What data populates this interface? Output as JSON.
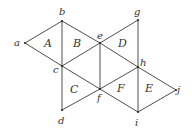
{
  "diagram": {
    "stroke_color": "#3a3a3a",
    "vertices": [
      {
        "id": "a",
        "x": 25,
        "y": 43,
        "label": "a",
        "lx": 14,
        "ly": 46
      },
      {
        "id": "b",
        "x": 62,
        "y": 21,
        "label": "b",
        "lx": 59,
        "ly": 15
      },
      {
        "id": "c",
        "x": 62,
        "y": 66,
        "label": "c",
        "lx": 53,
        "ly": 73
      },
      {
        "id": "d",
        "x": 62,
        "y": 110,
        "label": "d",
        "lx": 58,
        "ly": 124
      },
      {
        "id": "e",
        "x": 100,
        "y": 43,
        "label": "e",
        "lx": 97,
        "ly": 39
      },
      {
        "id": "f",
        "x": 100,
        "y": 89,
        "label": "f",
        "lx": 97,
        "ly": 101
      },
      {
        "id": "g",
        "x": 138,
        "y": 20,
        "label": "g",
        "lx": 134,
        "ly": 15
      },
      {
        "id": "h",
        "x": 138,
        "y": 67,
        "label": "h",
        "lx": 140,
        "ly": 66
      },
      {
        "id": "i",
        "x": 138,
        "y": 112,
        "label": "i",
        "lx": 135,
        "ly": 126
      },
      {
        "id": "j",
        "x": 176,
        "y": 90,
        "label": "j",
        "lx": 177,
        "ly": 93
      }
    ],
    "edges": [
      [
        "a",
        "b"
      ],
      [
        "a",
        "c"
      ],
      [
        "b",
        "c"
      ],
      [
        "b",
        "e"
      ],
      [
        "c",
        "e"
      ],
      [
        "c",
        "f"
      ],
      [
        "c",
        "d"
      ],
      [
        "d",
        "f"
      ],
      [
        "e",
        "f"
      ],
      [
        "e",
        "g"
      ],
      [
        "g",
        "h"
      ],
      [
        "e",
        "h"
      ],
      [
        "f",
        "h"
      ],
      [
        "h",
        "i"
      ],
      [
        "f",
        "i"
      ],
      [
        "h",
        "j"
      ],
      [
        "i",
        "j"
      ]
    ],
    "faces": [
      {
        "label": "A",
        "x": 44,
        "y": 47
      },
      {
        "label": "B",
        "x": 73,
        "y": 47
      },
      {
        "label": "C",
        "x": 70,
        "y": 93
      },
      {
        "label": "D",
        "x": 118,
        "y": 47
      },
      {
        "label": "F",
        "x": 117,
        "y": 92
      },
      {
        "label": "E",
        "x": 145,
        "y": 92
      }
    ]
  }
}
